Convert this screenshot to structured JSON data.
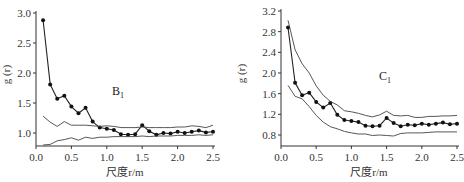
{
  "chart_data": [
    {
      "type": "line",
      "title": "",
      "panel_label": "B",
      "panel_label_sub": "1",
      "xlabel": "尺度r/m",
      "ylabel": "g (r)",
      "xlim": [
        0,
        2.5
      ],
      "ylim": [
        0.75,
        3.0
      ],
      "xticks": [
        0.0,
        0.5,
        1.0,
        1.5,
        2.0,
        2.5
      ],
      "xtick_labels": [
        "0.0",
        "0.5",
        "1.0",
        "1.5",
        "2.0",
        "2.5"
      ],
      "yticks": [
        1.0,
        1.5,
        2.0,
        2.5,
        3.0
      ],
      "ytick_labels": [
        "1.0",
        "1.5",
        "2.0",
        "2.5",
        "3.0"
      ],
      "grid": false,
      "x": [
        0.1,
        0.2,
        0.3,
        0.4,
        0.5,
        0.6,
        0.7,
        0.8,
        0.9,
        1.0,
        1.1,
        1.2,
        1.3,
        1.4,
        1.5,
        1.6,
        1.7,
        1.8,
        1.9,
        2.0,
        2.1,
        2.2,
        2.3,
        2.4,
        2.5
      ],
      "series": [
        {
          "name": "g(r) observed",
          "marker": "circle",
          "values": [
            2.88,
            1.81,
            1.57,
            1.62,
            1.44,
            1.33,
            1.42,
            1.19,
            1.09,
            1.07,
            1.05,
            0.98,
            0.97,
            0.98,
            1.13,
            1.03,
            0.97,
            1.0,
            0.99,
            1.02,
            1.0,
            1.02,
            1.04,
            1.01,
            1.02
          ]
        },
        {
          "name": "upper envelope",
          "marker": "none",
          "values": [
            1.28,
            1.18,
            1.11,
            1.19,
            1.13,
            1.13,
            1.13,
            1.12,
            1.11,
            1.12,
            1.11,
            1.09,
            1.09,
            1.09,
            1.1,
            1.09,
            1.09,
            1.09,
            1.09,
            1.1,
            1.1,
            1.12,
            1.11,
            1.09,
            1.13
          ]
        },
        {
          "name": "lower envelope",
          "marker": "none",
          "values": [
            0.8,
            0.81,
            0.87,
            0.89,
            0.92,
            0.88,
            0.93,
            0.91,
            0.93,
            0.93,
            0.94,
            0.94,
            0.94,
            0.94,
            0.95,
            0.94,
            0.95,
            0.95,
            0.95,
            0.96,
            0.96,
            0.96,
            0.97,
            0.96,
            0.97
          ]
        }
      ]
    },
    {
      "type": "line",
      "title": "",
      "panel_label": "C",
      "panel_label_sub": "1",
      "xlabel": "尺度r/m",
      "ylabel": "g (r)",
      "xlim": [
        0,
        2.5
      ],
      "ylim": [
        0.6,
        3.2
      ],
      "xticks": [
        0.0,
        0.5,
        1.0,
        1.5,
        2.0,
        2.5
      ],
      "xtick_labels": [
        "0.0",
        "0.5",
        "1.0",
        "1.5",
        "2.0",
        "2.5"
      ],
      "yticks": [
        0.8,
        1.2,
        1.6,
        2.0,
        2.4,
        2.8,
        3.2
      ],
      "ytick_labels": [
        "0.8",
        "1.2",
        "1.6",
        "2.0",
        "2.4",
        "2.8",
        "3.2"
      ],
      "grid": false,
      "x": [
        0.1,
        0.2,
        0.3,
        0.4,
        0.5,
        0.6,
        0.7,
        0.8,
        0.9,
        1.0,
        1.1,
        1.2,
        1.3,
        1.4,
        1.5,
        1.6,
        1.7,
        1.8,
        1.9,
        2.0,
        2.1,
        2.2,
        2.3,
        2.4,
        2.5
      ],
      "series": [
        {
          "name": "g(r) observed",
          "marker": "circle",
          "values": [
            2.88,
            1.81,
            1.57,
            1.62,
            1.44,
            1.33,
            1.42,
            1.19,
            1.09,
            1.07,
            1.05,
            0.98,
            0.97,
            0.98,
            1.13,
            1.03,
            0.97,
            1.0,
            0.99,
            1.02,
            1.0,
            1.02,
            1.04,
            1.01,
            1.02
          ]
        },
        {
          "name": "upper envelope",
          "marker": "none",
          "values": [
            3.02,
            2.45,
            2.18,
            2.0,
            1.75,
            1.57,
            1.45,
            1.38,
            1.27,
            1.25,
            1.22,
            1.18,
            1.15,
            1.19,
            1.26,
            1.18,
            1.17,
            1.18,
            1.14,
            1.14,
            1.16,
            1.16,
            1.17,
            1.17,
            1.18
          ]
        },
        {
          "name": "lower envelope",
          "marker": "none",
          "values": [
            1.76,
            1.55,
            1.5,
            1.35,
            1.18,
            1.05,
            0.96,
            0.92,
            0.87,
            0.84,
            0.82,
            0.82,
            0.79,
            0.8,
            0.79,
            0.78,
            0.83,
            0.84,
            0.84,
            0.84,
            0.85,
            0.86,
            0.86,
            0.86,
            0.86
          ]
        }
      ]
    }
  ]
}
